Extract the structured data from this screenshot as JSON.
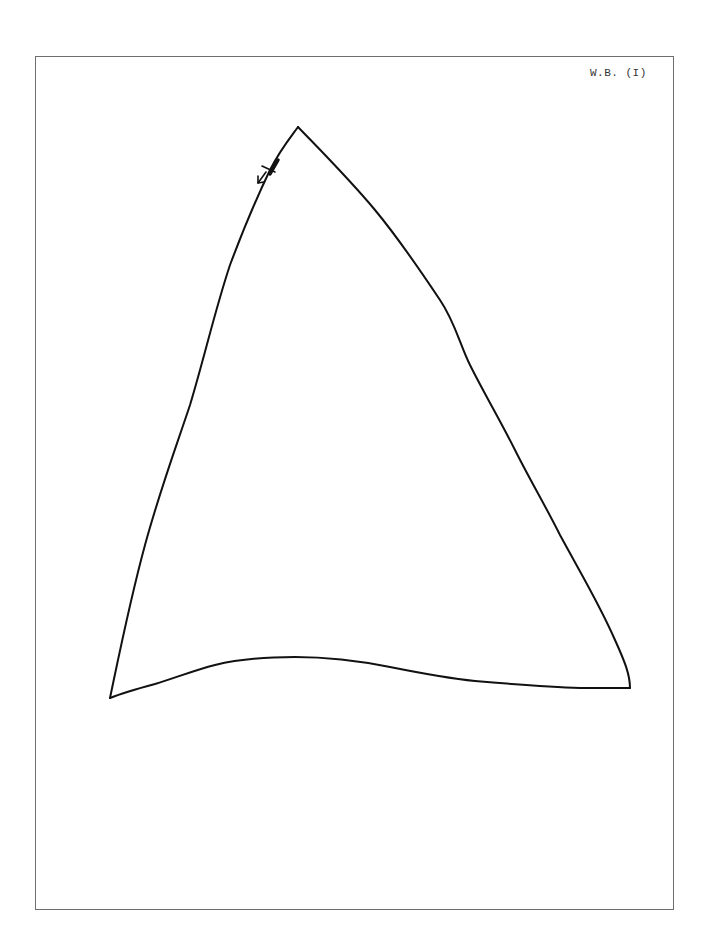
{
  "page": {
    "label": "W.B. (I)",
    "frame_color": "#6e6e6e",
    "ink_color": "#111111"
  },
  "drawing": {
    "shape": "sail-triangle",
    "vertices": {
      "top": [
        298,
        127
      ],
      "bottom_left": [
        110,
        698
      ],
      "bottom_right": [
        630,
        688
      ]
    },
    "marks": [
      {
        "type": "tick-mark",
        "position": [
          272,
          162
        ]
      },
      {
        "type": "arrow",
        "direction": "down-left",
        "position": [
          262,
          176
        ]
      }
    ]
  }
}
